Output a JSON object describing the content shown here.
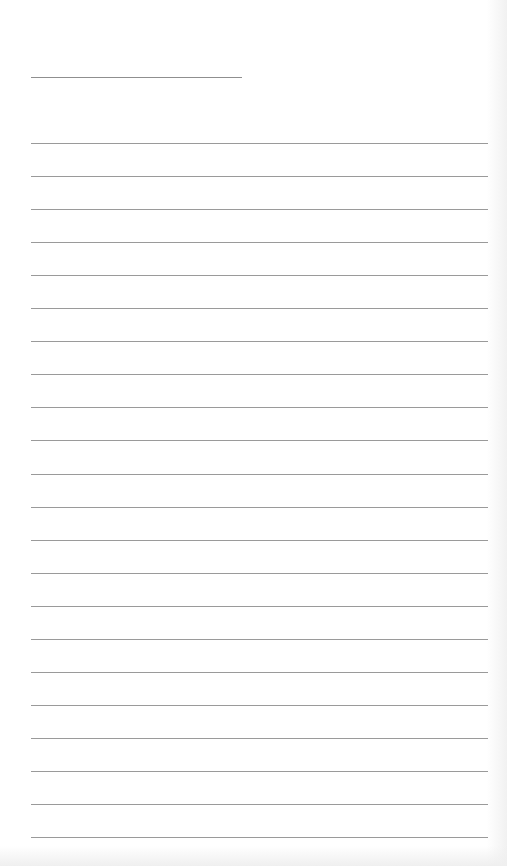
{
  "page": {
    "type": "blank lined sheet",
    "background_color": "#ffffff",
    "line_color": "#9a9a9a",
    "title_line": {
      "x": 31,
      "y": 77,
      "width": 211
    },
    "rules": {
      "count": 22,
      "start_y": 143,
      "spacing": 33.05,
      "x": 31,
      "width": 457
    }
  }
}
